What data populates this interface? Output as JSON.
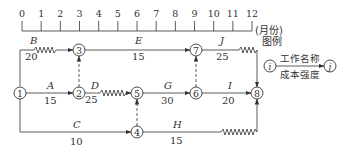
{
  "timescale": {
    "ticks": [
      "0",
      "1",
      "2",
      "3",
      "4",
      "5",
      "6",
      "7",
      "8",
      "9",
      "10",
      "11",
      "12"
    ],
    "unit_label": "(月份)"
  },
  "nodes": [
    {
      "id": "1",
      "label": "1"
    },
    {
      "id": "2",
      "label": "2"
    },
    {
      "id": "3",
      "label": "3"
    },
    {
      "id": "4",
      "label": "4"
    },
    {
      "id": "5",
      "label": "5"
    },
    {
      "id": "6",
      "label": "6"
    },
    {
      "id": "7",
      "label": "7"
    },
    {
      "id": "8",
      "label": "8"
    }
  ],
  "activities": [
    {
      "name": "A",
      "cost": "15",
      "from": "1",
      "to": "2"
    },
    {
      "name": "B",
      "cost": "20",
      "from": "1",
      "to": "3"
    },
    {
      "name": "C",
      "cost": "10",
      "from": "1",
      "to": "4"
    },
    {
      "name": "D",
      "cost": "25",
      "from": "2",
      "to": "5"
    },
    {
      "name": "E",
      "cost": "15",
      "from": "3",
      "to": "7"
    },
    {
      "name": "G",
      "cost": "30",
      "from": "5",
      "to": "6"
    },
    {
      "name": "H",
      "cost": "15",
      "from": "4",
      "to": "8"
    },
    {
      "name": "I",
      "cost": "20",
      "from": "6",
      "to": "8"
    },
    {
      "name": "J",
      "cost": "25",
      "from": "7",
      "to": "8"
    }
  ],
  "legend": {
    "title": "图例",
    "node_i": "i",
    "node_j": "j",
    "top_label": "工作名称",
    "bottom_label": "成本强度"
  }
}
